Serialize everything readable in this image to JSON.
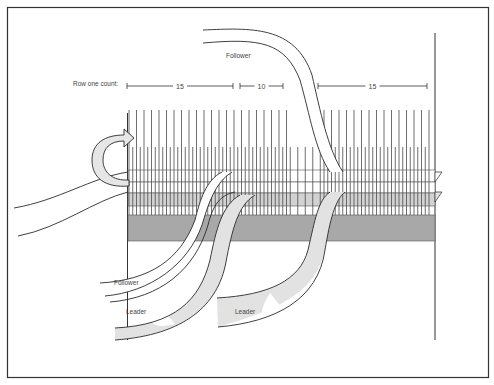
{
  "diagram": {
    "labels": {
      "follower_top": "Follower",
      "follower_bottom": "Follower",
      "leader_left": "Leader",
      "leader_right": "Leader",
      "row_count_caption": "Row one count:"
    },
    "row_one_count": [
      {
        "value": "15",
        "x1": 127,
        "x2": 233
      },
      {
        "value": "10",
        "x1": 240,
        "x2": 283
      },
      {
        "value": "15",
        "x1": 318,
        "x2": 427
      }
    ],
    "colors": {
      "stroke": "#2a2a2a",
      "warp": "#4a4a4a",
      "light_gray": "#e2e2e2",
      "mid_gray": "#b4b4b4",
      "band_gray": "#a8a8a8",
      "border": "#333333"
    }
  }
}
